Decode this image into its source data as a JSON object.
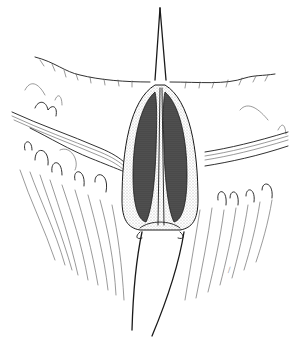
{
  "illustration": {
    "subject": "surgical line drawing: elongated incision with retracted wound edges and two stay sutures",
    "style": "black and white pen-and-ink with stippling",
    "colors": {
      "background": "#ffffff",
      "ink": "#1a1a1a",
      "stipple": "#9a9a9a",
      "dark_fill": "#3a3a3a"
    },
    "signature": "—"
  }
}
